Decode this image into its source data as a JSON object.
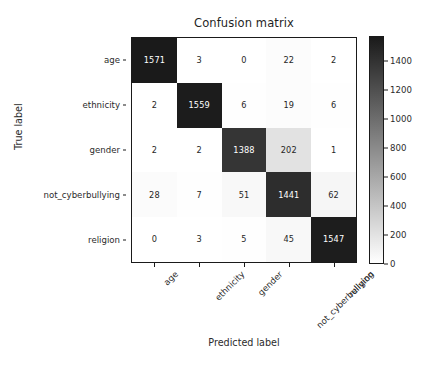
{
  "chart_data": {
    "type": "heatmap",
    "title": "Confusion matrix",
    "xlabel": "Predicted label",
    "ylabel": "True label",
    "categories": [
      "age",
      "ethnicity",
      "gender",
      "not_cyberbullying",
      "religion"
    ],
    "x_tick_labels": [
      "age",
      "ethnicity",
      "gender",
      "not_cyberbullying",
      "religion"
    ],
    "y_tick_labels": [
      "age",
      "ethnicity",
      "gender",
      "not_cyberbullying",
      "religion"
    ],
    "x_tick_rotation": -45,
    "grid": false,
    "legend": "none",
    "colormap": "gray_r",
    "matrix": [
      [
        1571,
        3,
        0,
        22,
        2
      ],
      [
        2,
        1559,
        6,
        19,
        6
      ],
      [
        2,
        2,
        1388,
        202,
        1
      ],
      [
        28,
        7,
        51,
        1441,
        62
      ],
      [
        0,
        3,
        5,
        45,
        1547
      ]
    ],
    "rows": [
      {
        "label": "age",
        "values": [
          1571,
          3,
          0,
          22,
          2
        ]
      },
      {
        "label": "ethnicity",
        "values": [
          2,
          1559,
          6,
          19,
          6
        ]
      },
      {
        "label": "gender",
        "values": [
          2,
          2,
          1388,
          202,
          1
        ]
      },
      {
        "label": "not_cyberbullying",
        "values": [
          28,
          7,
          51,
          1441,
          62
        ]
      },
      {
        "label": "religion",
        "values": [
          0,
          3,
          5,
          45,
          1547
        ]
      }
    ],
    "colorbar": {
      "ticks": [
        0,
        200,
        400,
        600,
        800,
        1000,
        1200,
        1400
      ],
      "tick_labels": [
        "0",
        "200",
        "400",
        "600",
        "800",
        "1000",
        "1200",
        "1400"
      ],
      "vmin": 0,
      "vmax": 1571,
      "orientation": "vertical",
      "position": "right"
    },
    "colors": {
      "high_value_cell": "#1a1a1a",
      "low_value_cell": "#ffffff",
      "mid_value_cell": "#ebebeb",
      "high_value_text": "#ffffff",
      "low_value_text": "#262626",
      "axis_line": "#1a1a1a",
      "text": "#2b2b2b",
      "background": "#ffffff"
    }
  }
}
